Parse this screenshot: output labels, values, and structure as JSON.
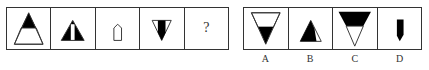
{
  "question": {
    "cells": [
      {
        "id": "q1",
        "shape": "upright triangle, top half black, bottom trapezoid white"
      },
      {
        "id": "q2",
        "shape": "upright triangle, black with white center vertical stripe"
      },
      {
        "id": "q3",
        "shape": "small white pentagon (house-like) outline"
      },
      {
        "id": "q4",
        "shape": "inverted triangle, white outline with black center stripe"
      },
      {
        "id": "q5",
        "shape": "unknown",
        "text": "?"
      }
    ]
  },
  "options": {
    "cells": [
      {
        "id": "A",
        "shape": "inverted triangle, top white trapezoid, bottom black"
      },
      {
        "id": "B",
        "shape": "upright triangle black with small white right sliver"
      },
      {
        "id": "C",
        "shape": "inverted triangle, top black trapezoid, bottom white"
      },
      {
        "id": "D",
        "shape": "small black pentagon pointing down"
      }
    ],
    "labels": [
      "A",
      "B",
      "C",
      "D"
    ]
  },
  "colors": {
    "line": "#333333",
    "fill": "#000000",
    "background": "#ffffff"
  }
}
